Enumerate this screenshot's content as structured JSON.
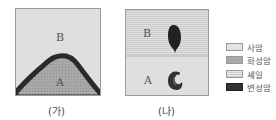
{
  "panels": [
    {
      "caption": "(가)",
      "layers": [
        {
          "label": "B",
          "rock": "사암",
          "position": "upper"
        },
        {
          "label": "A",
          "rock": "화성암",
          "position": "lower intrusion (dome)",
          "border": "변성암"
        }
      ]
    },
    {
      "caption": "(나)",
      "layers": [
        {
          "label": "B",
          "rock": "셰일",
          "position": "upper",
          "fossil": "dark oval fossil"
        },
        {
          "label": "A",
          "rock": "사암",
          "position": "lower",
          "fossil": "spiral shell fossil"
        }
      ]
    }
  ],
  "legend": [
    {
      "label": "사암",
      "pattern": "sandstone-dots",
      "color": "#e4e4e4"
    },
    {
      "label": "화성암",
      "pattern": "igneous-dots",
      "color": "#a9a9a9"
    },
    {
      "label": "셰일",
      "pattern": "shale-lines",
      "color": "#d8d8d8"
    },
    {
      "label": "변성암",
      "pattern": "metamorphic-dark",
      "color": "#333333"
    }
  ]
}
